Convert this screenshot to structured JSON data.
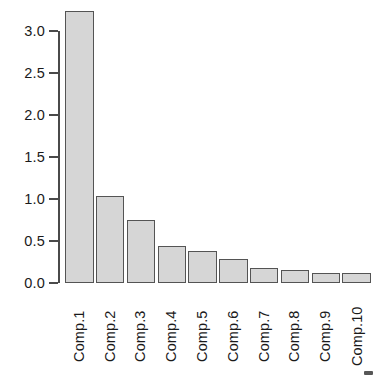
{
  "chart_data": {
    "type": "bar",
    "title": "",
    "subtitle": "",
    "xlabel": "",
    "ylabel": "",
    "categories": [
      "Comp.1",
      "Comp.2",
      "Comp.3",
      "Comp.4",
      "Comp.5",
      "Comp.6",
      "Comp.7",
      "Comp.8",
      "Comp.9",
      "Comp.10"
    ],
    "values": [
      3.24,
      1.04,
      0.75,
      0.44,
      0.38,
      0.29,
      0.18,
      0.15,
      0.12,
      0.12
    ],
    "ylim": [
      0.0,
      3.3
    ],
    "yticks": [
      0.0,
      0.5,
      1.0,
      1.5,
      2.0,
      2.5,
      3.0
    ],
    "ytick_labels": [
      "0.0",
      "0.5",
      "1.0",
      "1.5",
      "2.0",
      "2.5",
      "3.0"
    ],
    "grid": false,
    "legend": null,
    "annotations": [],
    "bar_fill_color": "#d6d6d6",
    "bar_border_color": "#545454",
    "axis_color": "#4a4a4a",
    "text_color": "#1a1a1a",
    "background_color": "#ffffff",
    "xtick_label_rotation": 90
  },
  "axis": {
    "y_tick_labels": [
      "3.0",
      "2.5",
      "2.0",
      "1.5",
      "1.0",
      "0.5",
      "0.0"
    ]
  },
  "x_labels": [
    "Comp.1",
    "Comp.2",
    "Comp.3",
    "Comp.4",
    "Comp.5",
    "Comp.6",
    "Comp.7",
    "Comp.8",
    "Comp.9",
    "Comp.10"
  ]
}
